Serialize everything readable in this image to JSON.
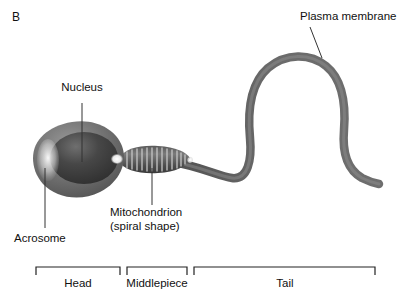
{
  "figure": {
    "panel_label": "B",
    "background_color": "#ffffff",
    "width": 415,
    "height": 304
  },
  "colors": {
    "cell_body": "#6e6e6e",
    "cell_body_dark": "#4a4a4a",
    "nucleus": "#3a3a3a",
    "acrosome_highlight": "#f2f2f2",
    "tail": "#5e5e5e",
    "leader_line": "#333333",
    "bracket": "#222222",
    "text": "#111111"
  },
  "callouts": [
    {
      "id": "nucleus",
      "text": "Nucleus",
      "text_x": 82,
      "text_y": 88,
      "anchor": "centered",
      "leader": {
        "x1": 82,
        "y1": 103,
        "x2": 82,
        "y2": 162
      }
    },
    {
      "id": "acrosome",
      "text": "Acrosome",
      "text_x": 14,
      "text_y": 232,
      "anchor": "left",
      "leader": {
        "x1": 45,
        "y1": 228,
        "x2": 45,
        "y2": 168
      }
    },
    {
      "id": "mitochondrion",
      "text": "Mitochondrion",
      "text_line2": "(spiral shape)",
      "text_x": 110,
      "text_y": 209,
      "anchor": "left",
      "leader": {
        "x1": 152,
        "y1": 205,
        "x2": 152,
        "y2": 168
      }
    },
    {
      "id": "plasma-membrane",
      "text": "Plasma membrane",
      "text_x": 300,
      "text_y": 10,
      "anchor": "left",
      "leader": {
        "x1": 310,
        "y1": 27,
        "x2": 322,
        "y2": 58
      }
    }
  ],
  "brackets": [
    {
      "id": "head",
      "label": "Head",
      "x_start": 36,
      "x_end": 120,
      "y": 267,
      "tick_height": 8,
      "label_x": 78,
      "label_y": 277
    },
    {
      "id": "middlepiece",
      "label": "Middlepiece",
      "x_start": 127,
      "x_end": 187,
      "y": 267,
      "tick_height": 8,
      "label_x": 157,
      "label_y": 277
    },
    {
      "id": "tail",
      "label": "Tail",
      "x_start": 194,
      "x_end": 375,
      "y": 267,
      "tick_height": 8,
      "label_x": 285,
      "label_y": 277
    }
  ],
  "structures": {
    "head": {
      "name": "sperm-head",
      "center_x": 83,
      "center_y": 160
    },
    "nucleus": {
      "name": "nucleus-oval",
      "center_x": 84,
      "center_y": 158
    },
    "acrosome": {
      "name": "acrosome-cap",
      "center_x": 48,
      "center_y": 160
    },
    "middlepiece": {
      "name": "middlepiece-segment",
      "center_x": 155,
      "center_y": 160
    },
    "mitochondria_bands": 13,
    "tail": {
      "name": "flagellum-tail"
    }
  }
}
